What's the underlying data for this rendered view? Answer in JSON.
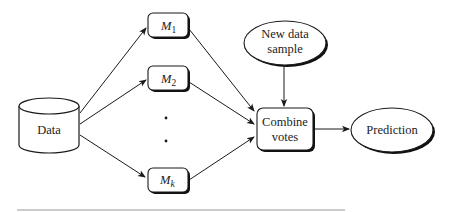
{
  "diagram": {
    "title": "",
    "nodes": {
      "data": {
        "label": "Data",
        "shape": "cylinder"
      },
      "m1": {
        "label": "M",
        "sub": "1",
        "shape": "rounded-box"
      },
      "m2": {
        "label": "M",
        "sub": "2",
        "shape": "rounded-box"
      },
      "ellipsis_dots": {
        "label": "• •",
        "shape": "dots"
      },
      "mk": {
        "label": "M",
        "sub": "k",
        "shape": "rounded-box"
      },
      "new_sample": {
        "label_line1": "New data",
        "label_line2": "sample",
        "shape": "ellipse"
      },
      "combine": {
        "label_line1": "Combine",
        "label_line2": "votes",
        "shape": "rounded-box"
      },
      "prediction": {
        "label": "Prediction",
        "shape": "ellipse"
      }
    },
    "edges": [
      {
        "from": "Data",
        "to": "M1"
      },
      {
        "from": "Data",
        "to": "M2"
      },
      {
        "from": "Data",
        "to": "Mk"
      },
      {
        "from": "M1",
        "to": "Combine votes"
      },
      {
        "from": "M2",
        "to": "Combine votes"
      },
      {
        "from": "Mk",
        "to": "Combine votes"
      },
      {
        "from": "New data sample",
        "to": "Combine votes"
      },
      {
        "from": "Combine votes",
        "to": "Prediction"
      }
    ],
    "colors": {
      "stroke": "#1a1a1a",
      "shadow": "#111111",
      "text": "#222222",
      "rule": "#9a9a9a"
    }
  }
}
